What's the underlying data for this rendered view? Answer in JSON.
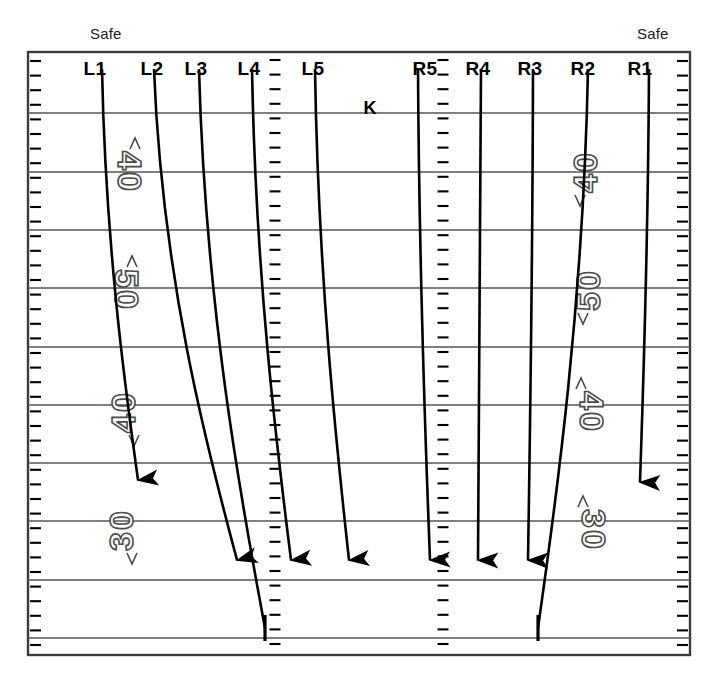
{
  "diagram": {
    "type": "football-play-diagram",
    "field": {
      "x": 28,
      "y": 52,
      "width": 662,
      "height": 603,
      "border_color": "#3d3d3d",
      "background_color": "#ffffff",
      "yard_lines_y": [
        113,
        172,
        230,
        288,
        347,
        405,
        463,
        521,
        580,
        638
      ],
      "yard_line_color": "#555555",
      "hash_columns_x": [
        275,
        443
      ],
      "sideline_tick_columns_x": [
        28,
        690
      ]
    },
    "safe_labels": [
      {
        "name": "safe-left",
        "text": "Safe",
        "x": 90,
        "y": 25
      },
      {
        "name": "safe-right",
        "text": "Safe",
        "x": 637,
        "y": 25
      }
    ],
    "kicker": {
      "label": "K",
      "x": 370,
      "y": 98
    },
    "lanes": [
      {
        "id": "L1",
        "label": "L1",
        "label_x": 95,
        "label_y": 58,
        "start_x": 102,
        "end_x": 138,
        "end_y": 480,
        "terminator": "arrow"
      },
      {
        "id": "L2",
        "label": "L2",
        "label_x": 152,
        "label_y": 58,
        "start_x": 154,
        "end_x": 237,
        "end_y": 560,
        "terminator": "arrow"
      },
      {
        "id": "L3",
        "label": "L3",
        "label_x": 196,
        "label_y": 58,
        "start_x": 199,
        "end_x": 265,
        "end_y": 628,
        "terminator": "bar"
      },
      {
        "id": "L4",
        "label": "L4",
        "label_x": 249,
        "label_y": 58,
        "start_x": 252,
        "end_x": 291,
        "end_y": 560,
        "terminator": "arrow"
      },
      {
        "id": "L5",
        "label": "L5",
        "label_x": 313,
        "label_y": 58,
        "start_x": 315,
        "end_x": 349,
        "end_y": 560,
        "terminator": "arrow"
      },
      {
        "id": "R5",
        "label": "R5",
        "label_x": 425,
        "label_y": 58,
        "start_x": 418,
        "end_x": 430,
        "end_y": 560,
        "terminator": "arrow"
      },
      {
        "id": "R4",
        "label": "R4",
        "label_x": 478,
        "label_y": 58,
        "start_x": 481,
        "end_x": 478,
        "end_y": 560,
        "terminator": "arrow"
      },
      {
        "id": "R3",
        "label": "R3",
        "label_x": 530,
        "label_y": 58,
        "start_x": 533,
        "end_x": 528,
        "end_y": 560,
        "terminator": "arrow"
      },
      {
        "id": "R2",
        "label": "R2",
        "label_x": 583,
        "label_y": 58,
        "start_x": 588,
        "end_x": 538,
        "end_y": 628,
        "terminator": "bar"
      },
      {
        "id": "R1",
        "label": "R1",
        "label_x": 640,
        "label_y": 58,
        "start_x": 649,
        "end_x": 640,
        "end_y": 482,
        "terminator": "arrow"
      }
    ],
    "yard_numbers": [
      {
        "side": "left",
        "text": "40",
        "x": 127,
        "y": 172,
        "rotation": 90
      },
      {
        "side": "left",
        "text": "50",
        "x": 124,
        "y": 290,
        "rotation": 90
      },
      {
        "side": "left",
        "text": "40",
        "x": 126,
        "y": 412,
        "rotation": -90
      },
      {
        "side": "left",
        "text": "30",
        "x": 124,
        "y": 530,
        "rotation": -90
      },
      {
        "side": "right",
        "text": "40",
        "x": 588,
        "y": 172,
        "rotation": -90
      },
      {
        "side": "right",
        "text": "50",
        "x": 591,
        "y": 290,
        "rotation": -90
      },
      {
        "side": "right",
        "text": "40",
        "x": 589,
        "y": 412,
        "rotation": 90
      },
      {
        "side": "right",
        "text": "30",
        "x": 591,
        "y": 530,
        "rotation": 90
      }
    ]
  }
}
